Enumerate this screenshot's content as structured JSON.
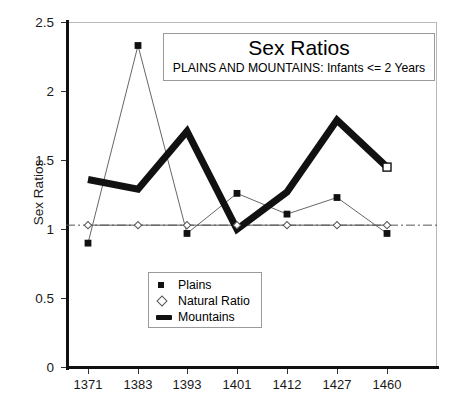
{
  "chart_data": {
    "type": "line",
    "title": "Sex Ratios",
    "subtitle": "PLAINS AND MOUNTAINS: Infants <= 2 Years",
    "xlabel": "",
    "ylabel": "Sex Ratios",
    "categories": [
      "1371",
      "1383",
      "1393",
      "1401",
      "1412",
      "1427",
      "1460"
    ],
    "ylim": [
      0,
      2.5
    ],
    "yticks": [
      "0",
      "0.5",
      "1",
      "1.5",
      "2",
      "2.5"
    ],
    "ytick_values": [
      0,
      0.5,
      1,
      1.5,
      2,
      2.5
    ],
    "grid": false,
    "legend_position": "lower-center-inside",
    "series": [
      {
        "name": "Plains",
        "marker": "filled-square",
        "line": "thin",
        "color": "#111111",
        "values": [
          0.9,
          2.33,
          0.97,
          1.26,
          1.11,
          1.23,
          0.97
        ]
      },
      {
        "name": "Natural Ratio",
        "marker": "open-diamond",
        "line": "dash-dot",
        "color": "#555555",
        "values": [
          1.03,
          1.03,
          1.03,
          1.03,
          1.03,
          1.03,
          1.03
        ]
      },
      {
        "name": "Mountains",
        "marker": "open-square-last",
        "line": "thick",
        "color": "#111111",
        "values": [
          1.36,
          1.29,
          1.71,
          1.0,
          1.27,
          1.79,
          1.45
        ]
      }
    ]
  },
  "legend": {
    "items": [
      {
        "label": "Plains"
      },
      {
        "label": "Natural Ratio"
      },
      {
        "label": "Mountains"
      }
    ]
  },
  "colors": {
    "ink": "#111111",
    "frame": "#b9b9b9",
    "natural": "#555555",
    "background": "#ffffff"
  }
}
